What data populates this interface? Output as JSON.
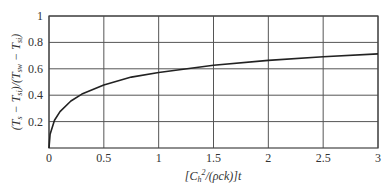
{
  "chart_data": {
    "type": "line",
    "title": "",
    "xlabel": "[C_h²/(ρck)]t",
    "ylabel": "(T_s − T_si)/(T_sw − T_si)",
    "xlim": [
      0,
      3
    ],
    "ylim": [
      0,
      1
    ],
    "grid": true,
    "legend": "none",
    "x_ticks": [
      "0",
      "0.5",
      "1",
      "1.5",
      "2",
      "2.5",
      "3"
    ],
    "y_ticks": [
      "0.2",
      "0.4",
      "0.6",
      "0.8",
      "1"
    ],
    "series": [
      {
        "name": "response",
        "x": [
          0,
          0.01,
          0.05,
          0.1,
          0.2,
          0.3,
          0.5,
          0.75,
          1.0,
          1.5,
          2.0,
          2.5,
          3.0
        ],
        "values": [
          0,
          0.104,
          0.21,
          0.276,
          0.356,
          0.408,
          0.477,
          0.537,
          0.572,
          0.627,
          0.664,
          0.691,
          0.713
        ]
      }
    ]
  },
  "colors": {
    "curve": "#222222",
    "grid": "#555555",
    "text": "#333333"
  }
}
